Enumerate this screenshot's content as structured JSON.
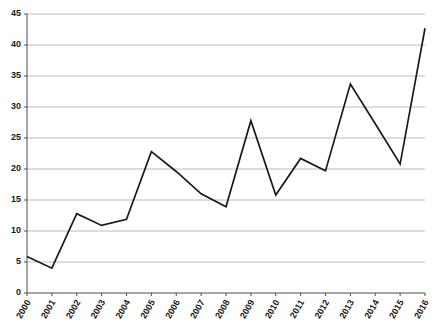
{
  "chart_data": {
    "type": "line",
    "title": "",
    "subtitle": "",
    "xlabel": "",
    "ylabel": "",
    "categories": [
      "2000",
      "2001",
      "2002",
      "2003",
      "2004",
      "2005",
      "2006",
      "2007",
      "2008",
      "2009",
      "2010",
      "2011",
      "2012",
      "2013",
      "2014",
      "2015",
      "2016"
    ],
    "values": [
      5.9,
      4.0,
      12.8,
      10.9,
      11.9,
      22.8,
      19.6,
      16.0,
      13.9,
      27.8,
      15.8,
      21.7,
      19.7,
      33.7,
      27.3,
      20.8,
      42.7
    ],
    "series": [
      {
        "name": "",
        "values": [
          5.9,
          4.0,
          12.8,
          10.9,
          11.9,
          22.8,
          19.6,
          16.0,
          13.9,
          27.8,
          15.8,
          21.7,
          19.7,
          33.7,
          27.3,
          20.8,
          42.7
        ]
      }
    ],
    "ylim": [
      0,
      45
    ],
    "yticks": [
      0,
      5,
      10,
      15,
      20,
      25,
      30,
      35,
      40,
      45
    ],
    "ytick_labels": [
      "0",
      "5",
      "10",
      "15",
      "20",
      "25",
      "30",
      "35",
      "40",
      "45"
    ],
    "xtick_labels": [
      "2000",
      "2001",
      "2002",
      "2003",
      "2004",
      "2005",
      "2006",
      "2007",
      "2008",
      "2009",
      "2010",
      "2011",
      "2012",
      "2013",
      "2014",
      "2015",
      "2016"
    ],
    "grid": true,
    "grid_axis": "y",
    "legend": false,
    "legend_position": "none",
    "annotations": [],
    "colors": {
      "line": "#1a1a1a",
      "grid": "#aaaaaa",
      "axis": "#4d4d4d",
      "text": "#1a1a1a",
      "background": "#ffffff"
    }
  },
  "plot": {
    "left": 27,
    "right": 425,
    "top": 14,
    "bottom": 293,
    "xlabel_rotation": -60
  }
}
